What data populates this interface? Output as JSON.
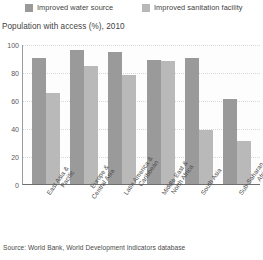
{
  "legend": {
    "items": [
      {
        "label": "Improved water source",
        "color": "#9a9a9a",
        "icon": "legend-swatch"
      },
      {
        "label": "Improved sanitation facility",
        "color": "#b9b9b9",
        "icon": "legend-swatch"
      }
    ]
  },
  "subtitle": "Population with access (%), 2010",
  "source": "Source: World Bank, World Development Indicators database",
  "chart_data": {
    "type": "bar",
    "title": "Population with access (%), 2010",
    "xlabel": "",
    "ylabel": "",
    "ylim": [
      0,
      100
    ],
    "yticks": [
      0,
      20,
      40,
      60,
      80,
      100
    ],
    "grid": true,
    "legend_position": "top",
    "categories": [
      "East Asia & Pacific",
      "Europe & Central Asia",
      "Latin America & Caribbean",
      "Middle East & North Africa",
      "South Asia",
      "Sub-Saharan Africa"
    ],
    "category_lines": [
      [
        "East Asia &",
        "Pacific"
      ],
      [
        "Europe &",
        "Central Asia"
      ],
      [
        "Latin America &",
        "Caribbean"
      ],
      [
        "Middle East &",
        "North Africa"
      ],
      [
        "South Asia"
      ],
      [
        "Sub-Saharan",
        "Africa"
      ]
    ],
    "series": [
      {
        "name": "Improved water source",
        "color": "#9a9a9a",
        "values": [
          90,
          96,
          94,
          88.5,
          90,
          61
        ]
      },
      {
        "name": "Improved sanitation facility",
        "color": "#b9b9b9",
        "values": [
          65,
          84,
          78,
          88,
          38.5,
          31
        ]
      }
    ]
  }
}
